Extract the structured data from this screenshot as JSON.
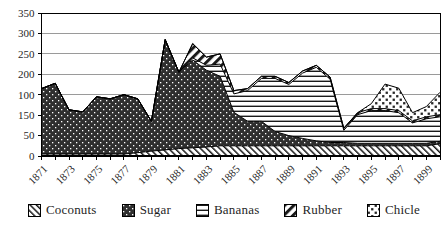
{
  "chart_data": {
    "type": "area",
    "stacked": true,
    "title": "",
    "xlabel": "",
    "ylabel": "",
    "x_start_year": 1871,
    "x_end_year": 1900,
    "x": [
      1871,
      1872,
      1873,
      1874,
      1875,
      1876,
      1877,
      1878,
      1879,
      1880,
      1881,
      1882,
      1883,
      1884,
      1885,
      1886,
      1887,
      1888,
      1889,
      1890,
      1891,
      1892,
      1893,
      1894,
      1895,
      1896,
      1897,
      1898,
      1899,
      1900
    ],
    "x_tick_labels": [
      "1871",
      "1873",
      "1875",
      "1877",
      "1879",
      "1881",
      "1883",
      "1885",
      "1887",
      "1889",
      "1891",
      "1893",
      "1895",
      "1897",
      "1899"
    ],
    "y_axis_labels_top_to_bottom": [
      "350",
      "300",
      "250",
      "200",
      "100",
      "150",
      "50",
      "0"
    ],
    "ylim": [
      0,
      350
    ],
    "gridline_step": 50,
    "grid": true,
    "legend_position": "bottom",
    "series": [
      {
        "name": "Coconuts",
        "pattern": "diagonal-hatch-backslash",
        "values": [
          5,
          5,
          5,
          5,
          5,
          5,
          5,
          8,
          12,
          15,
          18,
          20,
          22,
          25,
          25,
          25,
          25,
          25,
          25,
          25,
          25,
          25,
          25,
          25,
          25,
          25,
          25,
          25,
          25,
          30
        ]
      },
      {
        "name": "Sugar",
        "pattern": "dots-on-dark",
        "values": [
          160,
          173,
          108,
          103,
          140,
          135,
          145,
          132,
          73,
          270,
          187,
          215,
          188,
          170,
          82,
          60,
          60,
          35,
          25,
          18,
          12,
          8,
          8,
          6,
          6,
          6,
          6,
          6,
          6,
          6
        ]
      },
      {
        "name": "Bananas",
        "pattern": "horizontal-lines",
        "values": [
          0,
          0,
          0,
          0,
          0,
          0,
          0,
          0,
          0,
          0,
          0,
          5,
          12,
          30,
          45,
          75,
          105,
          130,
          125,
          160,
          180,
          155,
          30,
          70,
          80,
          80,
          75,
          50,
          60,
          60
        ]
      },
      {
        "name": "Rubber",
        "pattern": "diagonal-stripes-slash",
        "values": [
          0,
          0,
          0,
          0,
          0,
          0,
          0,
          0,
          0,
          0,
          0,
          35,
          20,
          25,
          8,
          5,
          5,
          5,
          5,
          5,
          5,
          5,
          5,
          5,
          5,
          5,
          5,
          5,
          5,
          5
        ]
      },
      {
        "name": "Chicle",
        "pattern": "square-dots-diagonal",
        "values": [
          0,
          0,
          0,
          0,
          0,
          0,
          0,
          0,
          0,
          0,
          0,
          0,
          0,
          0,
          0,
          0,
          0,
          0,
          0,
          0,
          0,
          0,
          0,
          0,
          12,
          60,
          55,
          20,
          25,
          55
        ]
      }
    ]
  },
  "colors": {
    "ink": "#1a1a1a",
    "pattern_dark": "#2f2f2f",
    "grid": "#9a9a9a",
    "text": "#1f1f1f",
    "background": "#ffffff"
  }
}
